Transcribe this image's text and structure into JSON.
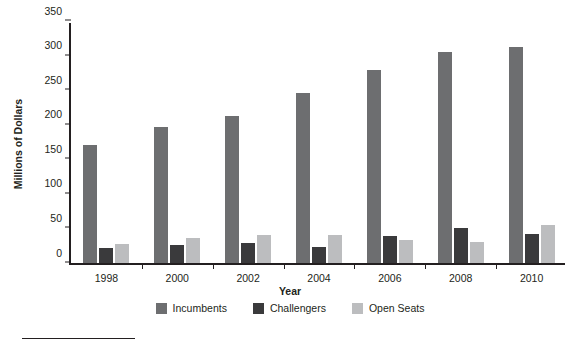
{
  "chart_data": {
    "type": "bar",
    "title": "",
    "xlabel": "Year",
    "ylabel": "Millions of Dollars",
    "categories": [
      "1998",
      "2000",
      "2002",
      "2004",
      "2006",
      "2008",
      "2010"
    ],
    "series": [
      {
        "name": "Incumbents",
        "color": "#6d6e70",
        "values": [
          171,
          196,
          213,
          246,
          279,
          305,
          312
        ]
      },
      {
        "name": "Challengers",
        "color": "#3a3a3c",
        "values": [
          22,
          26,
          29,
          23,
          39,
          50,
          42
        ]
      },
      {
        "name": "Open Seats",
        "color": "#bcbdbf",
        "values": [
          27,
          36,
          41,
          40,
          34,
          30,
          55
        ]
      }
    ],
    "ylim": [
      0,
      350
    ],
    "yticks": [
      0,
      50,
      100,
      150,
      200,
      250,
      300,
      350
    ],
    "ytick_labels": [
      "0",
      "50",
      "100",
      "150",
      "200",
      "250",
      "300",
      "350"
    ],
    "grid": false,
    "legend_position": "bottom"
  }
}
